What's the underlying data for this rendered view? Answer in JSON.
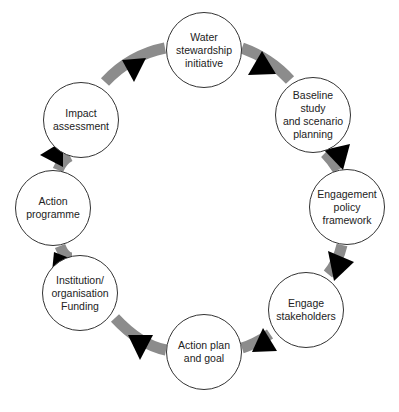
{
  "diagram": {
    "type": "cycle",
    "colors": {
      "ring": "#8c8c8c",
      "arrow": "#000000",
      "node_border": "#333333",
      "node_fill": "#ffffff",
      "text": "#222222"
    },
    "nodes": [
      {
        "id": "water",
        "label": "Water\nstewardship\ninitiative"
      },
      {
        "id": "baseline",
        "label": "Baseline\nstudy\nand scenario\nplanning"
      },
      {
        "id": "engagement-policy",
        "label": "Engagement\npolicy\nframework"
      },
      {
        "id": "engage-stakeholders",
        "label": "Engage\nstakeholders"
      },
      {
        "id": "action-plan",
        "label": "Action plan\nand goal"
      },
      {
        "id": "institution",
        "label": "Institution/\norganisation\nFunding"
      },
      {
        "id": "action-programme",
        "label": "Action\nprogramme"
      },
      {
        "id": "impact",
        "label": "Impact\nassessment"
      }
    ],
    "flow": "clockwise"
  }
}
